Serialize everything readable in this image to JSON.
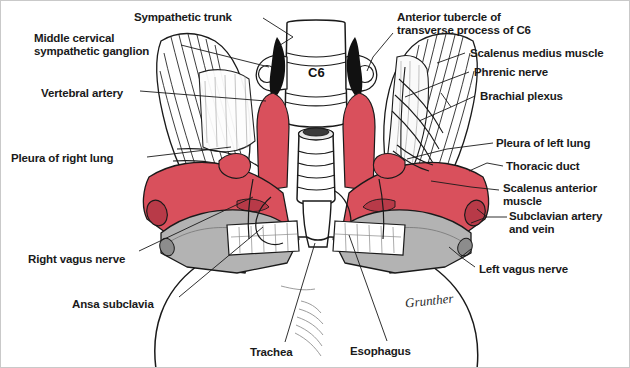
{
  "figure": {
    "kind": "anatomical-illustration",
    "signature": "Grunther",
    "colors": {
      "muscle_red": "#d9505c",
      "muscle_red_dark": "#b83a48",
      "vessel_gray": "#b3b3b3",
      "vessel_gray_dark": "#8c8c8c",
      "ink": "#1a1a1a",
      "paper": "#ffffff",
      "border": "#c9c9c9",
      "ganglion_black": "#111111"
    },
    "center_label": "C6"
  },
  "labels": {
    "left": [
      {
        "id": "middle-cervical-sympathetic-ganglion",
        "text": "Middle cervical\nsympathetic ganglion",
        "x": 33,
        "y": 31
      },
      {
        "id": "vertebral-artery",
        "text": "Vertebral artery",
        "x": 40,
        "y": 86
      },
      {
        "id": "pleura-of-right-lung",
        "text": "Pleura of right lung",
        "x": 10,
        "y": 151
      },
      {
        "id": "right-vagus-nerve",
        "text": "Right vagus nerve",
        "x": 27,
        "y": 252
      },
      {
        "id": "ansa-subclavia",
        "text": "Ansa subclavia",
        "x": 71,
        "y": 297
      }
    ],
    "top": [
      {
        "id": "sympathetic-trunk",
        "text": "Sympathetic trunk",
        "x": 133,
        "y": 10
      }
    ],
    "right": [
      {
        "id": "anterior-tubercle-of-transverse-process-of-c6",
        "text": "Anterior tubercle of\ntransverse process of C6",
        "x": 396,
        "y": 10
      },
      {
        "id": "scalenus-medius-muscle",
        "text": "Scalenus medius muscle",
        "x": 469,
        "y": 47
      },
      {
        "id": "phrenic-nerve",
        "text": "Phrenic nerve",
        "x": 473,
        "y": 66
      },
      {
        "id": "brachial-plexus",
        "text": "Brachial plexus",
        "x": 479,
        "y": 90
      },
      {
        "id": "pleura-of-left-lung",
        "text": "Pleura of left lung",
        "x": 495,
        "y": 137
      },
      {
        "id": "thoracic-duct",
        "text": "Thoracic duct",
        "x": 505,
        "y": 161
      },
      {
        "id": "scalenus-anterior-muscle",
        "text": "Scalenus anterior\nmuscle",
        "x": 502,
        "y": 182
      },
      {
        "id": "subclavian-artery-and-vein",
        "text": "Subclavian artery\nand vein",
        "x": 508,
        "y": 210
      },
      {
        "id": "left-vagus-nerve",
        "text": "Left vagus nerve",
        "x": 478,
        "y": 262
      }
    ],
    "bottom": [
      {
        "id": "trachea",
        "text": "Trachea",
        "x": 249,
        "y": 345
      },
      {
        "id": "esophagus",
        "text": "Esophagus",
        "x": 349,
        "y": 344
      }
    ]
  }
}
